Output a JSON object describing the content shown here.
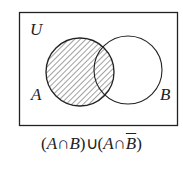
{
  "diagram": {
    "type": "venn",
    "universe_label": "U",
    "sets": [
      {
        "label": "A",
        "shaded": true
      },
      {
        "label": "B",
        "shaded": false
      }
    ],
    "shaded_region": "A",
    "colors": {
      "stroke": "#222222",
      "hatch": "#444444",
      "background": "#ffffff"
    }
  },
  "caption": {
    "open1": "(",
    "a1": "A",
    "cap1": "∩",
    "b1": "B",
    "close1": ")",
    "cup": "∪",
    "open2": "(",
    "a2": "A",
    "cap2": "∩",
    "b2": "B",
    "close2": ")"
  }
}
